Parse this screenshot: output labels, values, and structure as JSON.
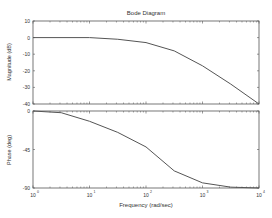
{
  "chart_data": [
    {
      "type": "line",
      "title": "Bode Diagram",
      "xlabel": "Frequency (rad/sec)",
      "ylabel": "Magnitude (dB)",
      "xscale": "log",
      "xlim": [
        1,
        10000
      ],
      "ylim": [
        -40,
        10
      ],
      "yticks": [
        10,
        0,
        -10,
        -20,
        -30,
        -40
      ],
      "x": [
        1,
        10,
        31.6,
        100,
        316,
        1000,
        3162,
        10000
      ],
      "values": [
        0,
        0,
        -1,
        -3,
        -8,
        -17,
        -28,
        -40
      ],
      "grid": false
    },
    {
      "type": "line",
      "xlabel": "Frequency (rad/sec)",
      "ylabel": "Phase (deg)",
      "xscale": "log",
      "xlim": [
        1,
        10000
      ],
      "ylim": [
        -90,
        0
      ],
      "yticks": [
        0,
        -45,
        -90
      ],
      "x": [
        1,
        3.16,
        10,
        31.6,
        100,
        316,
        1000,
        3162,
        10000
      ],
      "values": [
        0,
        -2,
        -12,
        -25,
        -42,
        -70,
        -84,
        -89,
        -90
      ],
      "grid": false
    }
  ],
  "labels": {
    "title": "Bode Diagram",
    "mag_ylabel": "Magnitude (dB)",
    "phase_ylabel": "Phase (deg)",
    "xlabel": "Frequency (rad/sec)",
    "mag_ticks": [
      "10",
      "0",
      "-10",
      "-20",
      "-30",
      "-40"
    ],
    "phase_ticks": [
      "0",
      "-45",
      "-90"
    ],
    "x_ticks": [
      "10",
      "10",
      "10",
      "10",
      "10"
    ],
    "x_exps": [
      "0",
      "1",
      "2",
      "3",
      "4"
    ]
  },
  "colors": {
    "line": "#555555",
    "axis": "#444444"
  }
}
